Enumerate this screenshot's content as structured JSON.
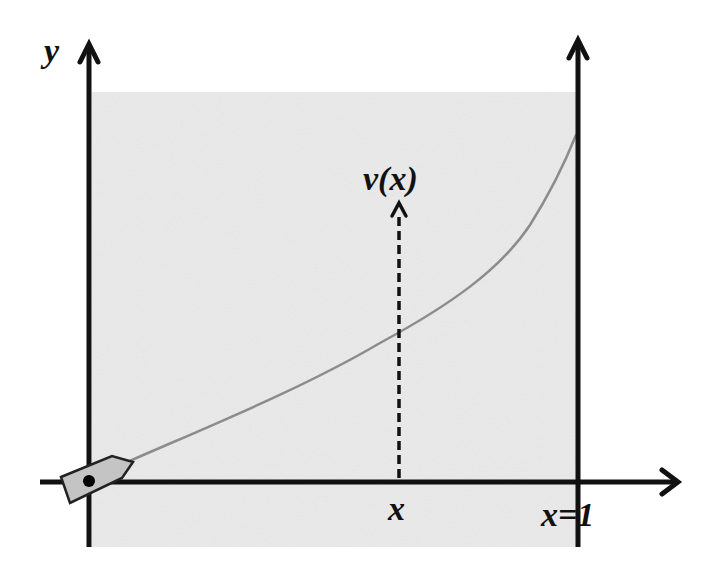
{
  "diagram": {
    "labels": {
      "y_axis": "y",
      "velocity": "v(x)",
      "x_position": "x",
      "far_bank": "x=1"
    },
    "elements": {
      "river_region": {
        "fill": "#ececec",
        "x0": 92,
        "y0": 92,
        "x1": 576,
        "y1": 547
      },
      "y_axis": {
        "x": 89,
        "y_top": 44,
        "y_bottom": 547
      },
      "far_bank_line": {
        "x": 578,
        "y_top": 40,
        "y_bottom": 547
      },
      "x_axis": {
        "y": 482,
        "x_left": 40,
        "x_right": 678
      },
      "velocity_arrow": {
        "x": 399,
        "y_top": 203,
        "y_bottom": 478,
        "style": "dashed"
      },
      "trajectory": {
        "color": "#8c8c8c",
        "points": [
          [
            125,
            463
          ],
          [
            200,
            430
          ],
          [
            300,
            386
          ],
          [
            399,
            333
          ],
          [
            460,
            296
          ],
          [
            520,
            240
          ],
          [
            576,
            135
          ]
        ]
      },
      "boat": {
        "fill": "#c4c4c4",
        "stroke": "#222222",
        "dot_color": "#000000"
      }
    },
    "colors": {
      "axis": "#111111",
      "river": "#ececec",
      "trajectory": "#8c8c8c",
      "boat_fill": "#c4c4c4"
    }
  }
}
